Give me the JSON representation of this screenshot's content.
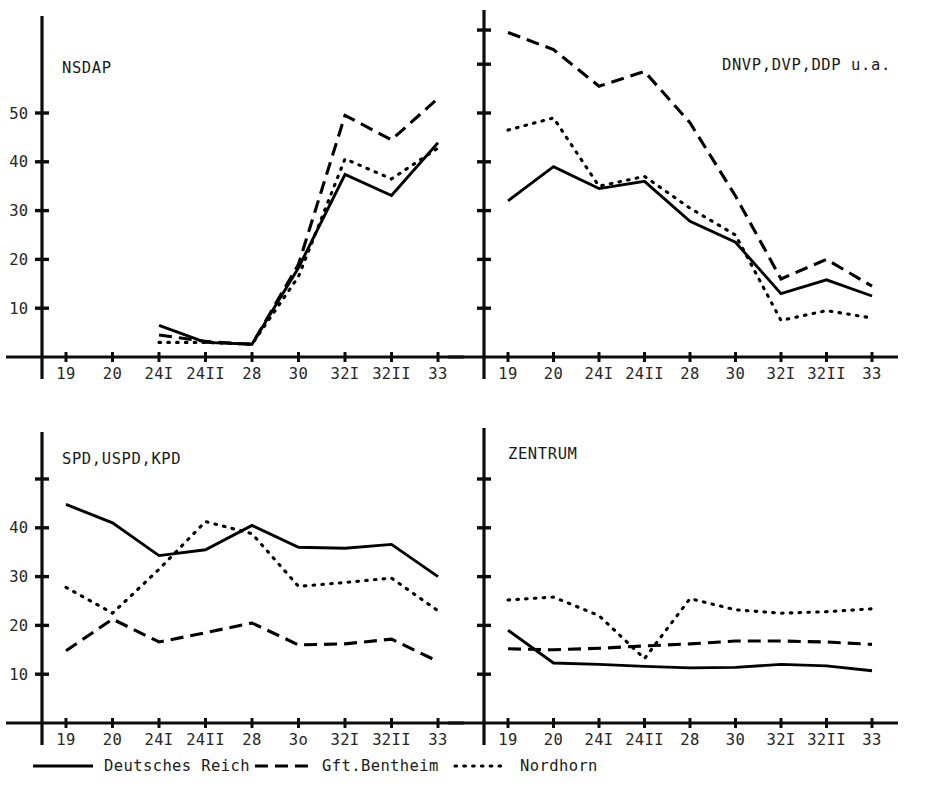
{
  "figure": {
    "width": 925,
    "height": 797,
    "background": "#ffffff",
    "ink_color": "#000000"
  },
  "legend": {
    "position": "bottom",
    "entries": [
      {
        "label": "Deutsches Reich",
        "style": "solid"
      },
      {
        "label": "Gft.Bentheim",
        "style": "dashed"
      },
      {
        "label": "Nordhorn",
        "style": "dotted"
      }
    ]
  },
  "chart_data": [
    {
      "type": "line",
      "title": "NSDAP",
      "panel": "top-left",
      "xlabel": "",
      "ylabel": "",
      "grid": false,
      "categories": [
        "19",
        "20",
        "24I",
        "24II",
        "28",
        "30",
        "32I",
        "32II",
        "33"
      ],
      "ytick_labels": [
        "10",
        "20",
        "30",
        "40",
        "50"
      ],
      "ytick_values": [
        10,
        20,
        30,
        40,
        50
      ],
      "ylim": [
        0,
        58
      ],
      "series": [
        {
          "name": "Deutsches Reich",
          "style": "solid",
          "values": [
            null,
            null,
            6.5,
            3.0,
            2.6,
            18.3,
            37.4,
            33.1,
            43.9
          ]
        },
        {
          "name": "Gft.Bentheim",
          "style": "dashed",
          "values": [
            null,
            null,
            4.5,
            3.2,
            2.6,
            19.0,
            49.5,
            44.5,
            53.0
          ]
        },
        {
          "name": "Nordhorn",
          "style": "dotted",
          "values": [
            null,
            null,
            3.0,
            3.0,
            2.6,
            16.5,
            40.6,
            36.5,
            42.8
          ]
        }
      ]
    },
    {
      "type": "line",
      "title": "DNVP,DVP,DDP u.a.",
      "panel": "top-right",
      "xlabel": "",
      "ylabel": "",
      "grid": false,
      "categories": [
        "19",
        "20",
        "24I",
        "24II",
        "28",
        "30",
        "32I",
        "32II",
        "33"
      ],
      "ytick_labels": [
        "",
        "",
        "",
        "",
        "",
        "",
        ""
      ],
      "ytick_values": [
        10,
        20,
        30,
        40,
        50,
        60,
        67
      ],
      "ylim": [
        0,
        72
      ],
      "series": [
        {
          "name": "Deutsches Reich",
          "style": "solid",
          "values": [
            32.0,
            39.0,
            34.5,
            36.0,
            27.8,
            23.5,
            13.0,
            15.8,
            12.5
          ]
        },
        {
          "name": "Gft.Bentheim",
          "style": "dashed",
          "values": [
            66.5,
            63.0,
            55.5,
            58.5,
            48.0,
            33.0,
            16.0,
            20.0,
            14.5
          ]
        },
        {
          "name": "Nordhorn",
          "style": "dotted",
          "values": [
            46.5,
            49.0,
            35.0,
            37.0,
            30.5,
            25.0,
            7.5,
            9.5,
            8.0
          ]
        }
      ]
    },
    {
      "type": "line",
      "title": "SPD,USPD,KPD",
      "panel": "bottom-left",
      "xlabel": "",
      "ylabel": "",
      "grid": false,
      "categories": [
        "19",
        "20",
        "24I",
        "24II",
        "28",
        "3o",
        "32I",
        "32II",
        "33"
      ],
      "ytick_labels": [
        "10",
        "20",
        "30",
        "40",
        ""
      ],
      "ytick_values": [
        10,
        20,
        30,
        40,
        50
      ],
      "ylim": [
        0,
        55
      ],
      "series": [
        {
          "name": "Deutsches Reich",
          "style": "solid",
          "values": [
            44.8,
            41.0,
            34.3,
            35.5,
            40.5,
            36.0,
            35.8,
            36.6,
            30.0
          ]
        },
        {
          "name": "Gft.Bentheim",
          "style": "dashed",
          "values": [
            14.8,
            21.3,
            16.6,
            18.5,
            20.5,
            16.0,
            16.2,
            17.2,
            12.6
          ]
        },
        {
          "name": "Nordhorn",
          "style": "dotted",
          "values": [
            27.8,
            22.5,
            31.5,
            41.3,
            38.8,
            28.0,
            28.8,
            29.7,
            23.0
          ]
        }
      ]
    },
    {
      "type": "line",
      "title": "ZENTRUM",
      "panel": "bottom-right",
      "xlabel": "",
      "ylabel": "",
      "grid": false,
      "categories": [
        "19",
        "20",
        "24I",
        "24II",
        "28",
        "30",
        "32I",
        "32II",
        "33"
      ],
      "ytick_labels": [
        "",
        "",
        "",
        "",
        ""
      ],
      "ytick_values": [
        10,
        20,
        30,
        40,
        50
      ],
      "ylim": [
        0,
        55
      ],
      "series": [
        {
          "name": "Deutsches Reich",
          "style": "solid",
          "values": [
            19.0,
            12.3,
            12.0,
            11.6,
            11.3,
            11.4,
            12.0,
            11.7,
            10.7
          ]
        },
        {
          "name": "Gft.Bentheim",
          "style": "dashed",
          "values": [
            15.2,
            15.0,
            15.3,
            15.8,
            16.2,
            16.8,
            16.8,
            16.6,
            16.1
          ]
        },
        {
          "name": "Nordhorn",
          "style": "dotted",
          "values": [
            25.2,
            25.8,
            22.0,
            13.2,
            25.5,
            23.2,
            22.5,
            22.8,
            23.4
          ]
        }
      ]
    }
  ]
}
